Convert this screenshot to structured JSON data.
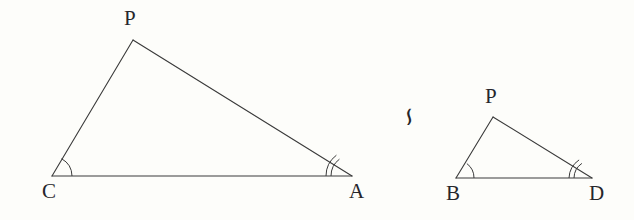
{
  "figure": {
    "background_color": "#fdfdfa",
    "stroke_color": "#3a3a3a",
    "text_color": "#26262a"
  },
  "relation": {
    "symbol": "∽",
    "name": "similar-to-symbol",
    "rotation_degrees": 90,
    "x": 398,
    "y": 104
  },
  "triangles": [
    {
      "name": "left-triangle",
      "label": "CPA",
      "vertices": [
        {
          "id": "C",
          "label": "C",
          "x": 52,
          "y": 176,
          "label_x": 42,
          "label_y": 181,
          "arcs": 1
        },
        {
          "id": "P",
          "label": "P",
          "x": 133,
          "y": 40,
          "label_x": 124,
          "label_y": 8,
          "arcs": 0
        },
        {
          "id": "A",
          "label": "A",
          "x": 352,
          "y": 176,
          "label_x": 349,
          "label_y": 181,
          "arcs": 2
        }
      ],
      "edges": [
        {
          "name": "edge-C-P",
          "from": "C",
          "to": "P"
        },
        {
          "name": "edge-P-A",
          "from": "P",
          "to": "A"
        },
        {
          "name": "edge-C-A",
          "from": "C",
          "to": "A"
        }
      ]
    },
    {
      "name": "right-triangle",
      "label": "BPD",
      "vertices": [
        {
          "id": "B",
          "label": "B",
          "x": 456,
          "y": 178,
          "label_x": 446,
          "label_y": 183,
          "arcs": 1
        },
        {
          "id": "P",
          "label": "P",
          "x": 493,
          "y": 117,
          "label_x": 485,
          "label_y": 86,
          "arcs": 0
        },
        {
          "id": "D",
          "label": "D",
          "x": 592,
          "y": 178,
          "label_x": 589,
          "label_y": 183,
          "arcs": 2
        }
      ],
      "edges": [
        {
          "name": "edge-B-P",
          "from": "B",
          "to": "P"
        },
        {
          "name": "edge-P-D",
          "from": "P",
          "to": "D"
        },
        {
          "name": "edge-B-D",
          "from": "B",
          "to": "D"
        }
      ]
    }
  ]
}
